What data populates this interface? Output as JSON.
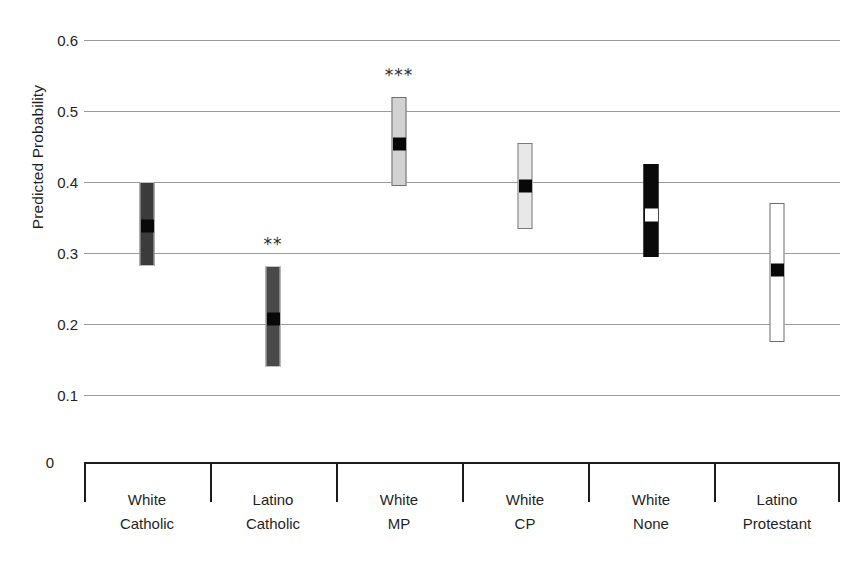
{
  "chart_data": {
    "type": "bar",
    "subtype": "confidence-interval-range-plot",
    "title": "",
    "xlabel": "",
    "ylabel": "Predicted Probability",
    "ylim": [
      0,
      0.6
    ],
    "ytick_values": [
      0,
      0.1,
      0.2,
      0.3,
      0.4,
      0.5,
      0.6
    ],
    "ytick_labels": [
      "0",
      "0.1",
      "0.2",
      "0.3",
      "0.4",
      "0.5",
      "0.6"
    ],
    "grid": true,
    "grid_axis": "y",
    "grid_color": "#9a9a9a",
    "legend": false,
    "categories": [
      "White Catholic",
      "Latino Catholic",
      "White MP",
      "White CP",
      "White None",
      "Latino Protestant"
    ],
    "category_lines": [
      [
        "White",
        "Catholic"
      ],
      [
        "Latino",
        "Catholic"
      ],
      [
        "White",
        "MP"
      ],
      [
        "White",
        "CP"
      ],
      [
        "White",
        "None"
      ],
      [
        "Latino",
        "Protestant"
      ]
    ],
    "values": [
      0.34,
      0.208,
      0.455,
      0.396,
      0.355,
      0.277
    ],
    "ci_low": [
      0.282,
      0.139,
      0.395,
      0.334,
      0.295,
      0.174
    ],
    "ci_high": [
      0.4,
      0.281,
      0.52,
      0.455,
      0.425,
      0.37
    ],
    "significance": [
      "",
      "**",
      "***",
      "",
      "",
      ""
    ],
    "bar_styles": [
      "dark",
      "midgray",
      "lightgray",
      "paleygray",
      "black",
      "white"
    ],
    "point_styles": [
      "blackdot",
      "blackdot",
      "blackdot",
      "blackdot",
      "whitedot",
      "blackdot"
    ],
    "bar_fill_colors": [
      "#3b3b3b",
      "#4a4a4a",
      "#d2d2d2",
      "#e8e8e8",
      "#0a0a0a",
      "#ffffff"
    ],
    "series": [
      {
        "name": "Predicted Probability",
        "points": [
          {
            "category": "White Catholic",
            "value": 0.34,
            "ci_low": 0.282,
            "ci_high": 0.4,
            "significance": ""
          },
          {
            "category": "Latino Catholic",
            "value": 0.208,
            "ci_low": 0.139,
            "ci_high": 0.281,
            "significance": "**"
          },
          {
            "category": "White MP",
            "value": 0.455,
            "ci_low": 0.395,
            "ci_high": 0.52,
            "significance": "***"
          },
          {
            "category": "White CP",
            "value": 0.396,
            "ci_low": 0.334,
            "ci_high": 0.455,
            "significance": ""
          },
          {
            "category": "White None",
            "value": 0.355,
            "ci_low": 0.295,
            "ci_high": 0.425,
            "significance": ""
          },
          {
            "category": "Latino Protestant",
            "value": 0.277,
            "ci_low": 0.174,
            "ci_high": 0.37,
            "significance": ""
          }
        ]
      }
    ]
  },
  "axis": {
    "zero_label": "0",
    "ylabel": "Predicted Probability"
  }
}
